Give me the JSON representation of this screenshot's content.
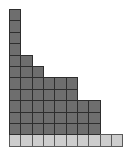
{
  "diagram": {
    "type": "young-diagram-columns",
    "columns": 10,
    "rows": 12,
    "cell_width": 11.35,
    "cell_height": 11.4,
    "column_heights": [
      12,
      8,
      7,
      6,
      6,
      6,
      4,
      4,
      1,
      1
    ],
    "bottom_row_style": "light",
    "colors": {
      "dark_cell": "#6e6e6e",
      "light_cell": "#cdcdcd",
      "border": "#2e2e2e",
      "background": "#ffffff"
    }
  }
}
